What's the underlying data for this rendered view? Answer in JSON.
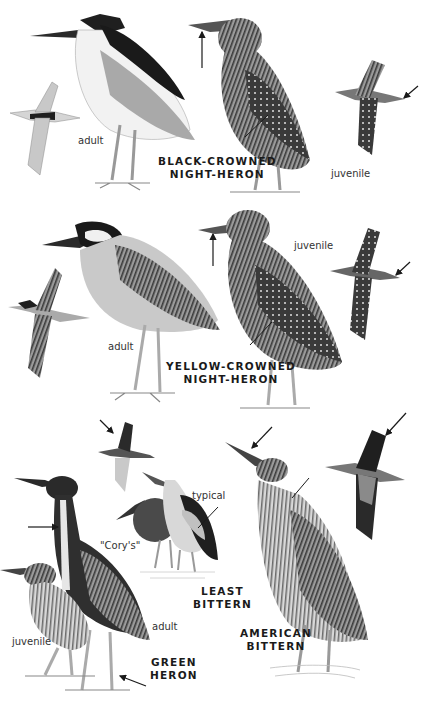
{
  "plate": {
    "species": [
      {
        "id": "black-crowned-night-heron",
        "name_line1": "BLACK-CROWNED",
        "name_line2": "NIGHT-HERON",
        "labels": [
          "adult",
          "juvenile"
        ]
      },
      {
        "id": "yellow-crowned-night-heron",
        "name_line1": "YELLOW-CROWNED",
        "name_line2": "NIGHT-HERON",
        "labels": [
          "adult",
          "juvenile"
        ]
      },
      {
        "id": "least-bittern",
        "name_line1": "LEAST",
        "name_line2": "BITTERN",
        "labels": [
          "typical",
          "\"Cory's\""
        ]
      },
      {
        "id": "green-heron",
        "name_line1": "GREEN",
        "name_line2": "HERON",
        "labels": [
          "adult",
          "juvenile"
        ]
      },
      {
        "id": "american-bittern",
        "name_line1": "AMERICAN",
        "name_line2": "BITTERN",
        "labels": []
      }
    ]
  },
  "colors": {
    "background": "#ffffff",
    "ink": "#1a1a1a",
    "plumage_dark": "#2a2a2a",
    "plumage_mid": "#8a8a8a",
    "plumage_light": "#cfcfcf"
  }
}
